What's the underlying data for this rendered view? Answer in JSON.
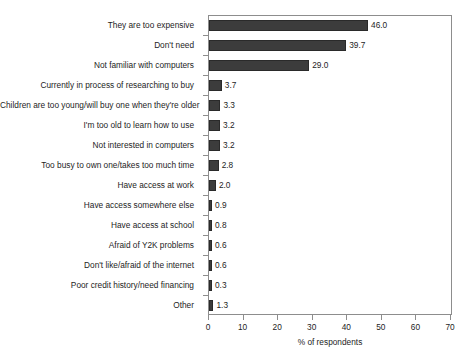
{
  "chart_data": {
    "type": "bar",
    "orientation": "horizontal",
    "title": "",
    "subtitle": "",
    "xlabel": "% of respondents",
    "ylabel": "",
    "xlim": [
      0,
      70
    ],
    "xticks": [
      0,
      10,
      20,
      30,
      40,
      50,
      60,
      70
    ],
    "xtick_labels": [
      "0",
      "10",
      "20",
      "30",
      "40",
      "50",
      "60",
      "70"
    ],
    "grid": false,
    "legend": null,
    "bar_color": "#3c3c3c",
    "frame_color": "#8d8d8d",
    "categories": [
      "They are too expensive",
      "Don't need",
      "Not familiar with computers",
      "Currently in process of researching to buy",
      "Children are too young/will buy one when they're older",
      "I'm too old to learn how to use",
      "Not interested in computers",
      "Too busy to own one/takes too much time",
      "Have access at work",
      "Have access somewhere else",
      "Have access at school",
      "Afraid of Y2K problems",
      "Don't like/afraid of the internet",
      "Poor credit history/need financing",
      "Other"
    ],
    "values": [
      46.0,
      39.7,
      29.0,
      3.7,
      3.3,
      3.2,
      3.2,
      2.8,
      2.0,
      0.9,
      0.8,
      0.6,
      0.6,
      0.3,
      1.3
    ],
    "value_labels": [
      "46.0",
      "39.7",
      "29.0",
      "3.7",
      "3.3",
      "3.2",
      "3.2",
      "2.8",
      "2.0",
      "0.9",
      "0.8",
      "0.6",
      "0.6",
      "0.3",
      "1.3"
    ]
  }
}
